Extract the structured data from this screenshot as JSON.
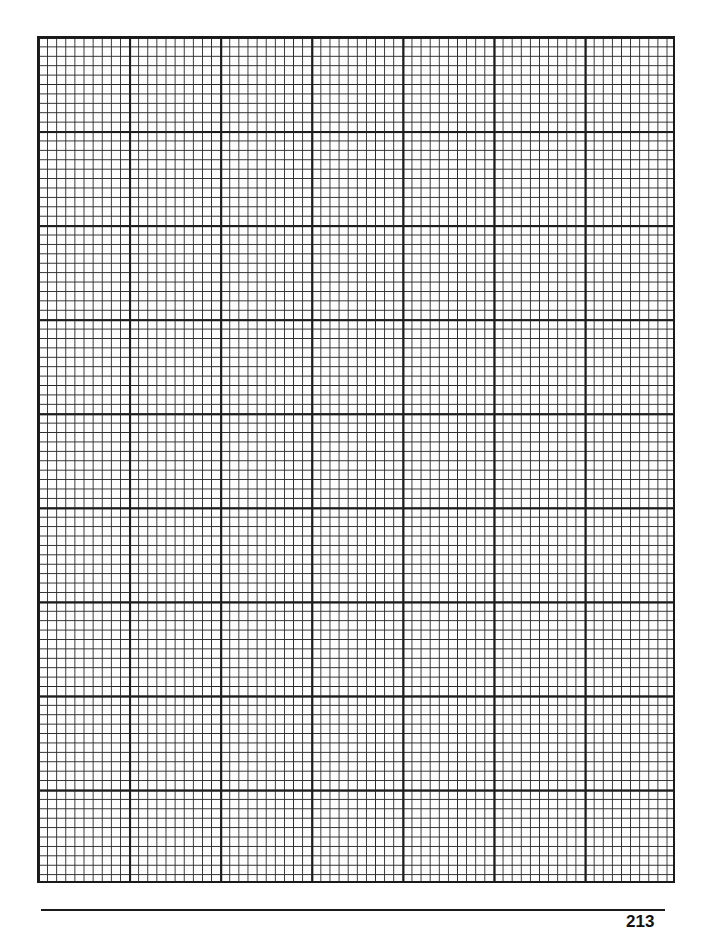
{
  "page": {
    "type": "graph-paper",
    "grid": {
      "major_columns": 7,
      "major_rows": 9,
      "minor_per_major": 10,
      "line_color": "#1c1c1c",
      "background_color": "#fdfdfd"
    },
    "footer": {
      "page_number": "213"
    }
  }
}
